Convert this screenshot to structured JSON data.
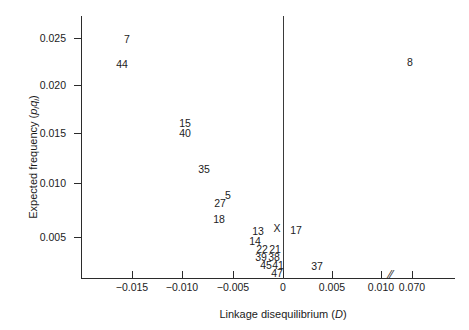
{
  "chart_data": {
    "type": "scatter",
    "title": "",
    "xlabel": "Linkage disequilibrium (D)",
    "ylabel": "Expected frequency (piqi)",
    "xlabel_parts": {
      "text": "Linkage disequilibrium (",
      "symbol": "D",
      "close": ")"
    },
    "ylabel_parts": {
      "text": "Expected frequency (",
      "sym1": "p",
      "sub1": "i",
      "sym2": "q",
      "sub2": "i",
      "close": ")"
    },
    "grid": false,
    "legend": "none",
    "axis_break": {
      "symbol": "//",
      "between": [
        0.01,
        0.07
      ]
    },
    "zero_reference_line": 0,
    "xticks": [
      -0.015,
      -0.01,
      -0.005,
      0,
      0.005,
      0.01,
      0.07
    ],
    "xtick_labels": [
      "−0.015",
      "−0.010",
      "−0.005",
      "0",
      "0.005",
      "0.010",
      "0.070"
    ],
    "xtick_px": [
      132,
      182,
      233,
      283,
      332,
      381,
      412
    ],
    "yticks": [
      0.005,
      0.01,
      0.015,
      0.02,
      0.025
    ],
    "ytick_labels": [
      "0.005",
      "0.010",
      "0.015",
      "0.020",
      "0.025"
    ],
    "ytick_px": [
      237,
      183,
      133,
      85,
      38
    ],
    "xlim": [
      -0.0185,
      0.0725
    ],
    "ylim": [
      0,
      0.0275
    ],
    "point_label_kind": "numeric-marker-ids",
    "points": [
      {
        "label": "7",
        "x": -0.013,
        "y": 0.0248,
        "px": 127,
        "py": 39
      },
      {
        "label": "44",
        "x": -0.0135,
        "y": 0.0222,
        "px": 122,
        "py": 64
      },
      {
        "label": "15",
        "x": -0.0072,
        "y": 0.0163,
        "px": 185,
        "py": 123
      },
      {
        "label": "40",
        "x": -0.0072,
        "y": 0.0157,
        "px": 185,
        "py": 133
      },
      {
        "label": "35",
        "x": -0.0053,
        "y": 0.012,
        "px": 204,
        "py": 169
      },
      {
        "label": "5",
        "x": -0.0029,
        "y": 0.0093,
        "px": 228,
        "py": 195
      },
      {
        "label": "27",
        "x": -0.0037,
        "y": 0.0085,
        "px": 220,
        "py": 203
      },
      {
        "label": "18",
        "x": -0.0038,
        "y": 0.0069,
        "px": 219,
        "py": 219
      },
      {
        "label": "13",
        "x": -0.0015,
        "y": 0.0058,
        "px": 258,
        "py": 231
      },
      {
        "label": "X",
        "x": -0.0006,
        "y": 0.006,
        "px": 277,
        "py": 228
      },
      {
        "label": "17",
        "x": 0.0008,
        "y": 0.0058,
        "px": 296,
        "py": 230
      },
      {
        "label": "14",
        "x": -0.0019,
        "y": 0.00505,
        "px": 255,
        "py": 241
      },
      {
        "label": "22",
        "x": -0.0013,
        "y": 0.0043,
        "px": 262,
        "py": 249
      },
      {
        "label": "21",
        "x": -0.0006,
        "y": 0.0043,
        "px": 275,
        "py": 249
      },
      {
        "label": "39",
        "x": -0.00135,
        "y": 0.00345,
        "px": 261,
        "py": 257
      },
      {
        "label": "38",
        "x": -0.0006,
        "y": 0.00345,
        "px": 274,
        "py": 257
      },
      {
        "label": "45",
        "x": -0.00105,
        "y": 0.00265,
        "px": 266,
        "py": 265
      },
      {
        "label": "41",
        "x": -0.00035,
        "y": 0.00265,
        "px": 278,
        "py": 265
      },
      {
        "label": "47",
        "x": -0.00045,
        "y": 0.00185,
        "px": 277,
        "py": 273
      },
      {
        "label": "37",
        "x": 0.0034,
        "y": 0.0006,
        "px": 317,
        "py": 266
      },
      {
        "label": "8",
        "x": 0.07,
        "y": 0.0228,
        "px": 410,
        "py": 62
      }
    ]
  }
}
